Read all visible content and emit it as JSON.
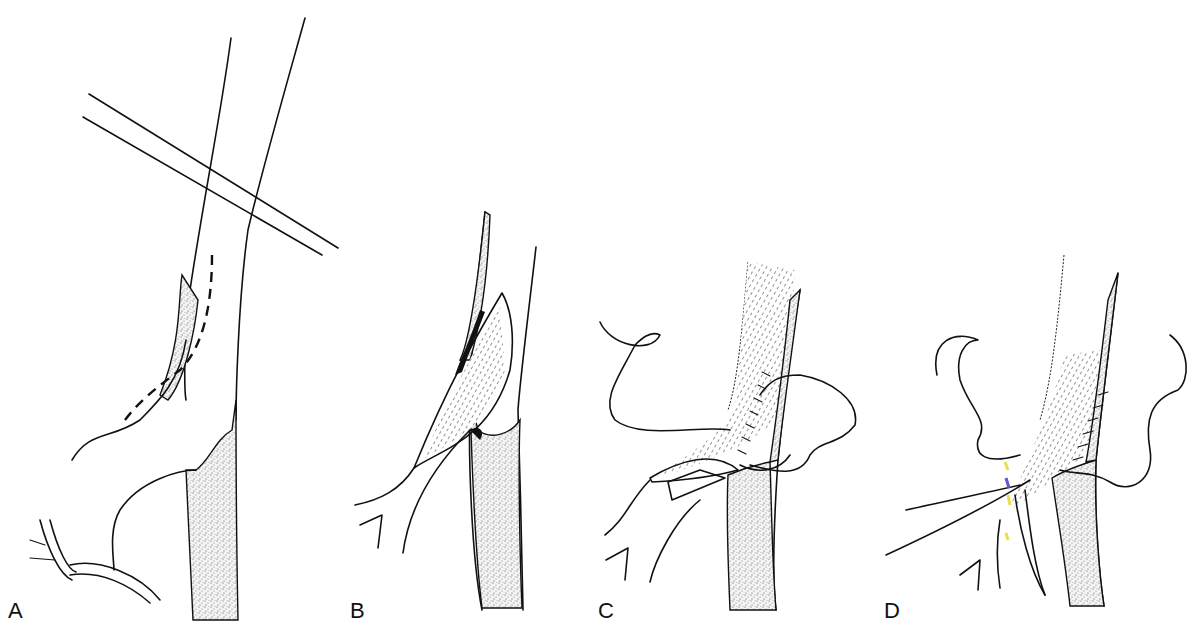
{
  "figure": {
    "panels": [
      {
        "id": "A",
        "label": "A",
        "description": "Vessel segment with crossing structure and dashed incision line along branch"
      },
      {
        "id": "B",
        "label": "B",
        "description": "Vessel opened along incision showing elliptical arteriotomy"
      },
      {
        "id": "C",
        "label": "C",
        "description": "Patch/graft being sutured into arteriotomy with looping suture"
      },
      {
        "id": "D",
        "label": "D",
        "description": "Completion of suture line with multiple suture strands"
      }
    ],
    "colors": {
      "line": "#111111",
      "background": "#ffffff",
      "stipple": "#555555",
      "highlight": "#e8e04a",
      "highlight_alt": "#5a5ad0"
    }
  }
}
